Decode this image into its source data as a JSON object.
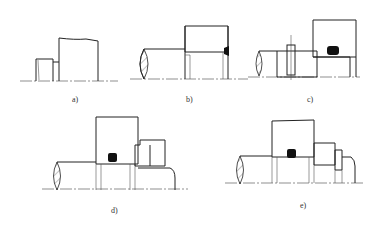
{
  "figure": {
    "panels": [
      {
        "id": "a",
        "label": "a)",
        "components": [
          "shaft-shoulder",
          "bearing-ring",
          "housing"
        ]
      },
      {
        "id": "b",
        "label": "b)",
        "components": [
          "shaft",
          "hatched-housing",
          "bearing",
          "weld"
        ]
      },
      {
        "id": "c",
        "label": "c)",
        "components": [
          "shaft",
          "pin",
          "hatched-collar",
          "hatched-housing",
          "o-ring-seal",
          "bearing"
        ]
      },
      {
        "id": "d",
        "label": "d)",
        "components": [
          "shaft",
          "hatched-housing",
          "o-ring-seal",
          "bearing",
          "hatched-nut",
          "lock-washer"
        ]
      },
      {
        "id": "e",
        "label": "e)",
        "components": [
          "shaft",
          "hatched-housing",
          "o-ring-seal",
          "bearing",
          "spacer",
          "nut"
        ]
      }
    ],
    "colors": {
      "line": "#222222",
      "seal": "#111111",
      "background": "#ffffff"
    }
  }
}
